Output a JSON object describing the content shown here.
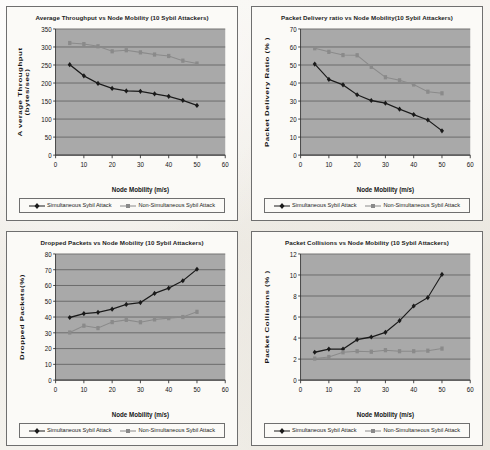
{
  "page": {
    "background_color": "#f3f1ec",
    "figure_count": 4
  },
  "series_style": {
    "simultaneous": {
      "color": "#1a1a1a",
      "marker": "diamond",
      "name_key": "Simultaneous Sybil Attack"
    },
    "non_simultaneous": {
      "color": "#8a8a8a",
      "marker": "square",
      "name_key": "Non-Simultaneous Sybil Attack"
    },
    "plot_bg": "#a9a9a9",
    "gridline_color": "#4d4d4d",
    "axis_color": "#333333"
  },
  "chart_data": [
    {
      "id": "average-throughput",
      "type": "line",
      "title": "Average Throughput vs Node Mobility (10 Sybil Attackers)",
      "xlabel": "Node Mobility (m/s)",
      "ylabel": "A verage Throughput (bytes/sec)",
      "ylabel_lines": [
        "A verage Throughput",
        "(bytes/sec)"
      ],
      "x": [
        5,
        10,
        15,
        20,
        25,
        30,
        35,
        40,
        45,
        50
      ],
      "xlim": [
        0,
        60
      ],
      "ylim": [
        0,
        350
      ],
      "xticks": [
        0,
        10,
        20,
        30,
        40,
        50,
        60
      ],
      "yticks": [
        0,
        50,
        100,
        150,
        200,
        250,
        300,
        350
      ],
      "grid": true,
      "legend_position": "bottom",
      "series": [
        {
          "name": "Simultaneous Sybil Attack",
          "values": [
            251,
            220,
            199,
            185,
            178,
            177,
            170,
            163,
            152,
            138
          ]
        },
        {
          "name": "Non-Simultaneous Sybil Attack",
          "values": [
            311,
            308,
            302,
            288,
            291,
            285,
            279,
            275,
            262,
            254
          ]
        }
      ]
    },
    {
      "id": "packet-delivery-ratio",
      "type": "line",
      "title": "Packet Delivery ratio vs Node Mobility(10 Sybil Attackers)",
      "xlabel": "Node Mobility (m/s)",
      "ylabel": "Packet Delivery Ratio (% )",
      "ylabel_lines": [
        "Packet Delivery Ratio (% )"
      ],
      "x": [
        5,
        10,
        15,
        20,
        25,
        30,
        35,
        40,
        45,
        50
      ],
      "xlim": [
        0,
        60
      ],
      "ylim": [
        0,
        70
      ],
      "xticks": [
        0,
        10,
        20,
        30,
        40,
        50,
        60
      ],
      "yticks": [
        0,
        10,
        20,
        30,
        40,
        50,
        60,
        70
      ],
      "grid": true,
      "legend_position": "bottom",
      "series": [
        {
          "name": "Simultaneous Sybil Attack",
          "values": [
            50.5,
            42,
            39,
            33.5,
            30.3,
            28.8,
            25.5,
            22.5,
            19.5,
            13.5
          ]
        },
        {
          "name": "Non-Simultaneous Sybil Attack",
          "values": [
            59.3,
            57.3,
            55.5,
            55.4,
            49,
            43.2,
            41.5,
            39.2,
            35.2,
            34.3
          ]
        }
      ]
    },
    {
      "id": "dropped-packets",
      "type": "line",
      "title": "Dropped Packets vs Node Mobility (10 Sybil Attackers)",
      "xlabel": "Node Mobility (m/s)",
      "ylabel": "Dropped Packets(%)",
      "ylabel_lines": [
        "Dropped Packets(%)"
      ],
      "x": [
        5,
        10,
        15,
        20,
        25,
        30,
        35,
        40,
        45,
        50
      ],
      "xlim": [
        0,
        60
      ],
      "ylim": [
        0,
        80
      ],
      "xticks": [
        0,
        10,
        20,
        30,
        40,
        50,
        60
      ],
      "yticks": [
        0,
        10,
        20,
        30,
        40,
        50,
        60,
        70,
        80
      ],
      "grid": true,
      "legend_position": "bottom",
      "series": [
        {
          "name": "Simultaneous Sybil Attack",
          "values": [
            39.7,
            42.2,
            43,
            45,
            48,
            49.2,
            55,
            58.3,
            63,
            70.3
          ]
        },
        {
          "name": "Non-Simultaneous Sybil Attack",
          "values": [
            30.2,
            34.5,
            33,
            36.8,
            38.2,
            36.7,
            38.5,
            39.3,
            40,
            43.3
          ]
        }
      ]
    },
    {
      "id": "packet-collisions",
      "type": "line",
      "title": "Packet Collisions vs Node Mobility (10 Sybil Attackers)",
      "xlabel": "Node Mobility (m/s)",
      "ylabel": "Packet Collisions (% )",
      "ylabel_lines": [
        "Packet Collisions (% )"
      ],
      "x": [
        5,
        10,
        15,
        20,
        25,
        30,
        35,
        40,
        45,
        50
      ],
      "xlim": [
        0,
        60
      ],
      "ylim": [
        0,
        12
      ],
      "xticks": [
        0,
        10,
        20,
        30,
        40,
        50,
        60
      ],
      "yticks": [
        0,
        2,
        4,
        6,
        8,
        10,
        12
      ],
      "grid": true,
      "legend_position": "bottom",
      "series": [
        {
          "name": "Simultaneous Sybil Attack",
          "values": [
            2.65,
            2.95,
            2.95,
            3.85,
            4.1,
            4.55,
            5.65,
            7.05,
            7.85,
            10.05
          ]
        },
        {
          "name": "Non-Simultaneous Sybil Attack",
          "values": [
            2.05,
            2.2,
            2.65,
            2.75,
            2.7,
            2.85,
            2.75,
            2.75,
            2.8,
            3.0
          ]
        }
      ]
    }
  ],
  "legends": [
    {
      "chart": "average-throughput",
      "entries": [
        "Simultaneous Sybil Attack",
        "Non-Simultaneous Sybil Attack"
      ]
    },
    {
      "chart": "packet-delivery-ratio",
      "entries": [
        "Simultaneous Sybil Attack",
        "Non-Simultaneous Sybil Attack"
      ]
    },
    {
      "chart": "dropped-packets",
      "entries": [
        "Simultaneous Sybil Attack",
        "Non-Simultaneous Sybil Attack"
      ]
    },
    {
      "chart": "packet-collisions",
      "entries": [
        "Simultaneous Sybil Attack",
        "Non-Simultaneous Sybil Attack"
      ]
    }
  ]
}
